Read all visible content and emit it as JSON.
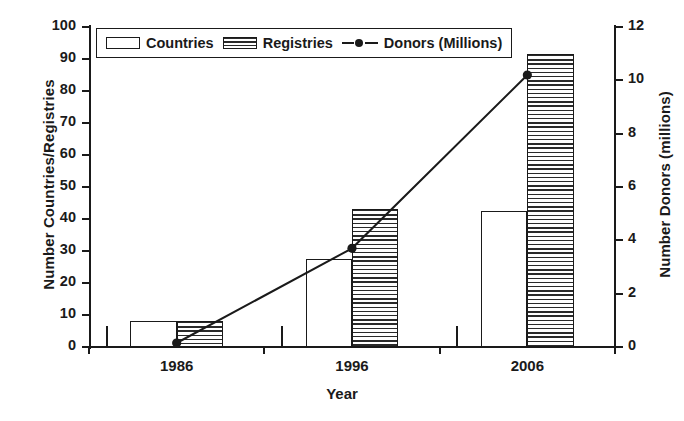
{
  "chart_data": {
    "type": "bar",
    "title": "",
    "xlabel": "Year",
    "ylabel": "Number Countries/Registries",
    "y2label": "Number Donors (millions)",
    "categories": [
      "1986",
      "1996",
      "2006"
    ],
    "ylim": [
      0,
      100
    ],
    "y2lim": [
      0,
      12
    ],
    "yticks": [
      0,
      10,
      20,
      30,
      40,
      50,
      60,
      70,
      80,
      90,
      100
    ],
    "y2ticks": [
      0,
      2,
      4,
      6,
      8,
      10,
      12
    ],
    "grid": false,
    "legend_position": "top-left-inside",
    "series": [
      {
        "name": "Countries",
        "type": "bar",
        "axis": "left",
        "values": [
          8,
          27.5,
          42.5
        ]
      },
      {
        "name": "Registries",
        "type": "bar",
        "axis": "left",
        "values": [
          8,
          43,
          91.5
        ]
      },
      {
        "name": "Donors (Millions)",
        "type": "line",
        "axis": "right",
        "values": [
          0.15,
          3.7,
          10.2
        ]
      }
    ]
  },
  "axes": {
    "y_left_title": "Number Countries/Registries",
    "y_right_title": "Number Donors (millions)",
    "x_title": "Year",
    "y_left_ticks": [
      "100",
      "90",
      "80",
      "70",
      "60",
      "50",
      "40",
      "30",
      "20",
      "10",
      "0"
    ],
    "y_right_ticks": [
      "12",
      "10",
      "8",
      "6",
      "4",
      "2",
      "0"
    ],
    "x_ticks": [
      "1986",
      "1996",
      "2006"
    ]
  },
  "legend": {
    "items": [
      {
        "label": "Countries",
        "marker": "open-rect-swatch"
      },
      {
        "label": "Registries",
        "marker": "hatched-rect-swatch"
      },
      {
        "label": "Donors (Millions)",
        "marker": "line-with-dot-swatch"
      }
    ]
  },
  "colors": {
    "ink": "#1a1a1a",
    "background": "#ffffff",
    "hatch": "#2a2a2a"
  }
}
